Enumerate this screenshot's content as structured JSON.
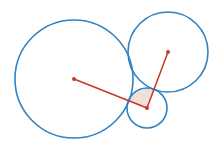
{
  "diagram": {
    "type": "three-tangent-circles",
    "colors": {
      "circle_stroke": "#2f82c4",
      "radius_line": "#c9382a",
      "center_dot": "#c9382a",
      "sector_fill": "#efe1d8",
      "background": "#ffffff"
    },
    "circles": [
      {
        "name": "large-left",
        "cx": 74,
        "cy": 79,
        "r": 59
      },
      {
        "name": "upper-right",
        "cx": 168,
        "cy": 52,
        "r": 40
      },
      {
        "name": "small-bottom",
        "cx": 147,
        "cy": 108,
        "r": 20
      }
    ],
    "segments": [
      {
        "name": "radius-to-large",
        "x1": 147,
        "y1": 108,
        "x2": 74,
        "y2": 79
      },
      {
        "name": "radius-to-upper",
        "x1": 147,
        "y1": 108,
        "x2": 168,
        "y2": 52
      }
    ],
    "sector": {
      "name": "angle-sector",
      "cx": 147,
      "cy": 108,
      "r": 20
    }
  }
}
